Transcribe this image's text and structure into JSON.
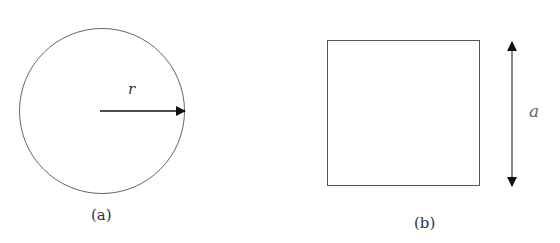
{
  "figure_a": {
    "shape": "circle",
    "radius_label": "r",
    "caption": "(a)"
  },
  "figure_b": {
    "shape": "square",
    "side_label": "a",
    "caption": "(b)"
  },
  "colors": {
    "stroke": "#555555",
    "arrow": "#111111"
  }
}
